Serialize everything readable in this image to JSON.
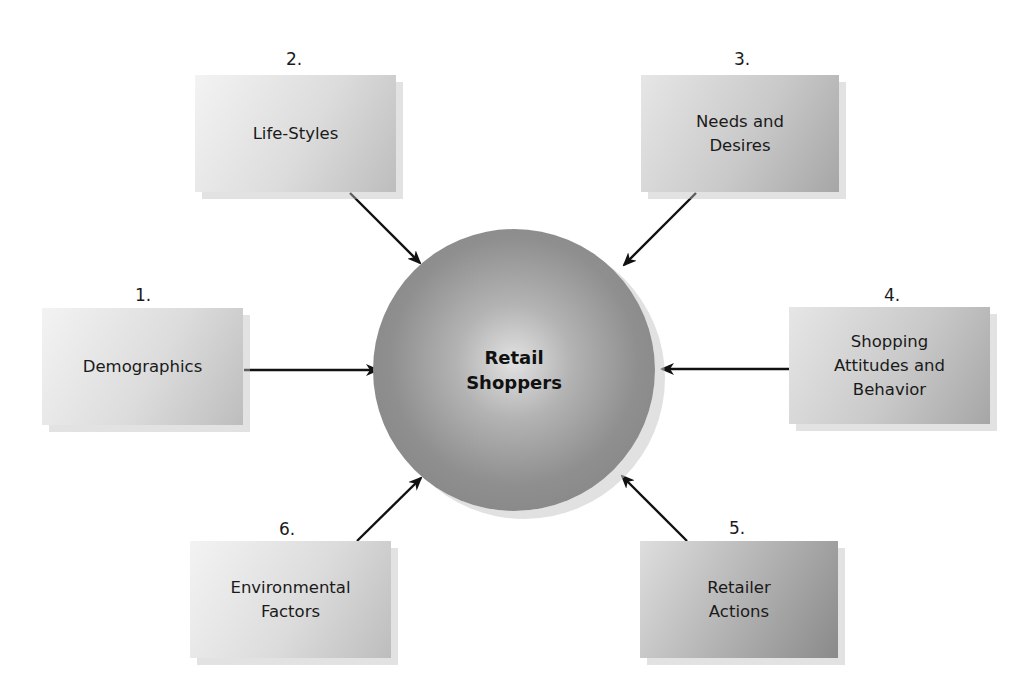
{
  "diagram": {
    "center": {
      "label_line1": "Retail",
      "label_line2": "Shoppers"
    },
    "factors": [
      {
        "number": "1.",
        "label_lines": [
          "Demographics"
        ]
      },
      {
        "number": "2.",
        "label_lines": [
          "Life-Styles"
        ]
      },
      {
        "number": "3.",
        "label_lines": [
          "Needs and",
          "Desires"
        ]
      },
      {
        "number": "4.",
        "label_lines": [
          "Shopping",
          "Attitudes and",
          "Behavior"
        ]
      },
      {
        "number": "5.",
        "label_lines": [
          "Retailer",
          "Actions"
        ]
      },
      {
        "number": "6.",
        "label_lines": [
          "Environmental",
          "Factors"
        ]
      }
    ],
    "colors": {
      "arrow": "#111111",
      "circle": "#8f8f8f",
      "box_light": "#dcdcdc",
      "box_dark": "#a6a6a6"
    }
  }
}
